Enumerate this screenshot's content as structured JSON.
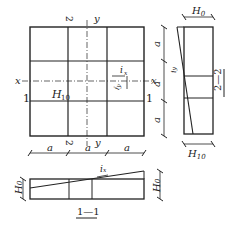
{
  "plan": {
    "axis_x_left": "x",
    "axis_x_right": "x",
    "axis_y_top": "y",
    "axis_y_bottom": "y",
    "section2_top": "2",
    "section2_bottom": "2",
    "section1_left": "1",
    "section1_right": "1",
    "h10_label": "H",
    "h10_sub": "10",
    "ix_label": "i",
    "ix_sub": "x",
    "iy_label": "i",
    "iy_sub": "y",
    "dim_a": "a"
  },
  "section_2_2": {
    "title": "2—2",
    "h0_label": "H",
    "h0_sub": "0",
    "h10_label": "H",
    "h10_sub": "10",
    "iy_label": "i",
    "iy_sub": "y",
    "dim_a": "a"
  },
  "section_1_1": {
    "title": "1—1",
    "h0_label": "H",
    "h0_sub": "0",
    "ix_label": "i",
    "ix_sub": "x"
  }
}
